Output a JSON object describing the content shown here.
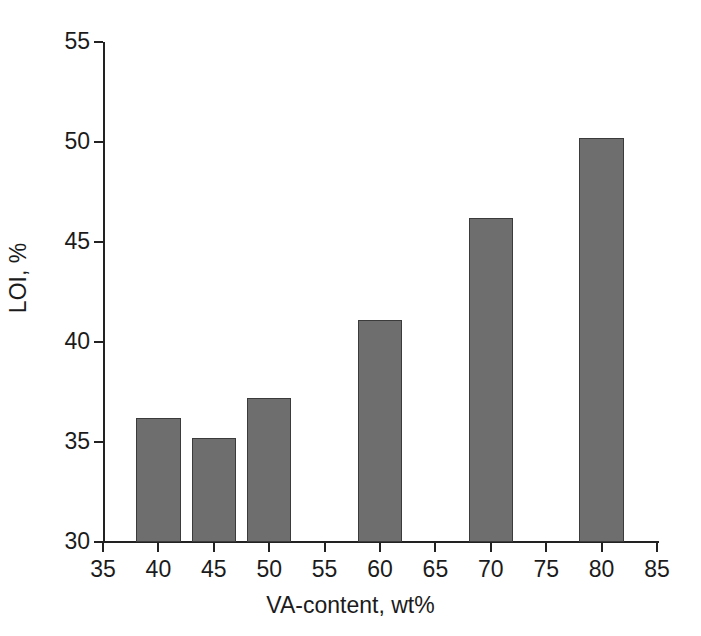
{
  "chart_data": {
    "type": "bar",
    "title": "",
    "xlabel": "VA-content, wt%",
    "ylabel": "LOI, %",
    "x": [
      40,
      45,
      50,
      60,
      70,
      80
    ],
    "categories": [
      "40",
      "45",
      "50",
      "60",
      "70",
      "80"
    ],
    "values": [
      36.2,
      35.2,
      37.2,
      41.1,
      46.2,
      50.2
    ],
    "series": [
      {
        "name": "LOI",
        "values": [
          36.2,
          35.2,
          37.2,
          41.1,
          46.2,
          50.2
        ]
      }
    ],
    "xlim": [
      35,
      85
    ],
    "ylim": [
      30,
      55
    ],
    "xticks": [
      35,
      40,
      45,
      50,
      55,
      60,
      65,
      70,
      75,
      80,
      85
    ],
    "yticks": [
      30,
      35,
      40,
      45,
      50,
      55
    ],
    "xtick_labels": [
      "35",
      "40",
      "45",
      "50",
      "55",
      "60",
      "65",
      "70",
      "75",
      "80",
      "85"
    ],
    "ytick_labels": [
      "30",
      "35",
      "40",
      "45",
      "50",
      "55"
    ],
    "grid": false,
    "legend": false,
    "bar_width_units": 4,
    "bar_color": "#6e6e6e",
    "bar_edge_color": "#3b3b3b",
    "axis_color": "#222222",
    "background_color": "#ffffff",
    "text_color": "#1b1b1b"
  }
}
